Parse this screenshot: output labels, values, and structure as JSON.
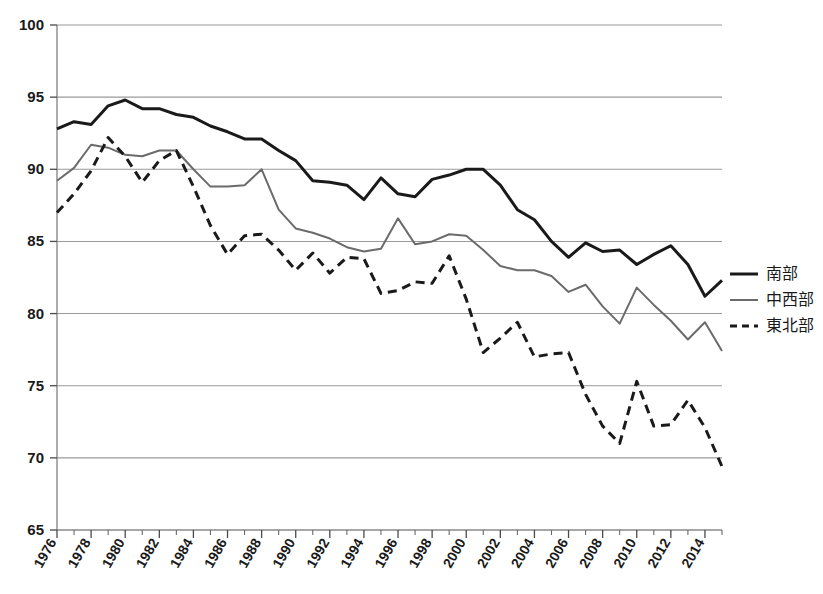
{
  "chart_data": {
    "type": "line",
    "title": "",
    "xlabel": "",
    "ylabel": "",
    "xlim": [
      1976,
      2015
    ],
    "ylim": [
      65,
      100
    ],
    "grid": true,
    "legend_position": "right",
    "y_ticks": [
      65,
      70,
      75,
      80,
      85,
      90,
      95,
      100
    ],
    "x_ticks": [
      1976,
      1978,
      1980,
      1982,
      1984,
      1986,
      1988,
      1990,
      1992,
      1994,
      1996,
      1998,
      2000,
      2002,
      2004,
      2006,
      2008,
      2010,
      2012,
      2014
    ],
    "x": [
      1976,
      1977,
      1978,
      1979,
      1980,
      1981,
      1982,
      1983,
      1984,
      1985,
      1986,
      1987,
      1988,
      1989,
      1990,
      1991,
      1992,
      1993,
      1994,
      1995,
      1996,
      1997,
      1998,
      1999,
      2000,
      2001,
      2002,
      2003,
      2004,
      2005,
      2006,
      2007,
      2008,
      2009,
      2010,
      2011,
      2012,
      2013,
      2014,
      2015
    ],
    "series": [
      {
        "name": "南部",
        "style": "solid",
        "color": "#1a1a1a",
        "width": 3.0,
        "values": [
          92.8,
          93.3,
          93.1,
          94.4,
          94.8,
          94.2,
          94.2,
          93.8,
          93.6,
          93.0,
          92.6,
          92.1,
          92.1,
          91.3,
          90.6,
          89.2,
          89.1,
          88.9,
          87.9,
          89.4,
          88.3,
          88.1,
          89.3,
          89.6,
          90.0,
          90.0,
          88.9,
          87.2,
          86.5,
          85.0,
          83.9,
          84.9,
          84.3,
          84.4,
          83.4,
          84.1,
          84.7,
          83.4,
          81.2,
          82.3
        ]
      },
      {
        "name": "中西部",
        "style": "solid",
        "color": "#6b6b6b",
        "width": 2.0,
        "values": [
          89.2,
          90.1,
          91.7,
          91.5,
          91.0,
          90.9,
          91.3,
          91.3,
          90.0,
          88.8,
          88.8,
          88.9,
          90.0,
          87.2,
          85.9,
          85.6,
          85.2,
          84.6,
          84.3,
          84.5,
          86.6,
          84.8,
          85.0,
          85.5,
          85.4,
          84.4,
          83.3,
          83.0,
          83.0,
          82.6,
          81.5,
          82.0,
          80.5,
          79.3,
          81.8,
          80.6,
          79.5,
          78.2,
          79.4,
          77.4
        ]
      },
      {
        "name": "東北部",
        "style": "dashed",
        "color": "#1a1a1a",
        "width": 3.0,
        "values": [
          87.0,
          88.3,
          89.9,
          92.2,
          90.9,
          89.1,
          90.6,
          91.3,
          88.8,
          86.1,
          84.1,
          85.4,
          85.5,
          84.4,
          83.0,
          84.2,
          82.8,
          83.9,
          83.8,
          81.4,
          81.6,
          82.2,
          82.1,
          84.0,
          81.0,
          77.3,
          78.3,
          79.4,
          77.0,
          77.2,
          77.3,
          74.4,
          72.2,
          71.0,
          75.3,
          72.2,
          72.3,
          74.0,
          72.1,
          69.4
        ]
      }
    ]
  },
  "legend": {
    "entries": [
      {
        "label": "南部",
        "style": "solid",
        "color": "#1a1a1a"
      },
      {
        "label": "中西部",
        "style": "solid",
        "color": "#6b6b6b"
      },
      {
        "label": "東北部",
        "style": "dashed",
        "color": "#1a1a1a"
      }
    ]
  }
}
